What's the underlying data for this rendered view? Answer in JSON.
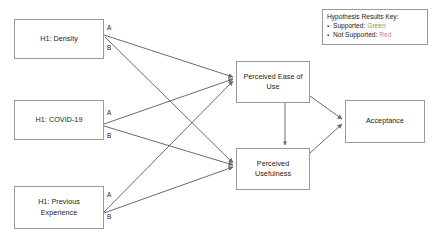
{
  "diagram": {
    "nodes": {
      "density": {
        "label": "H1: Density"
      },
      "covid": {
        "label": "H1: COVID-19"
      },
      "previous": {
        "label": "H1: Previous\nExperience"
      },
      "ease_of_use": {
        "label": "Perceived Ease of Use"
      },
      "usefulness": {
        "label": "Perceived Usefulness"
      },
      "acceptance": {
        "label": "Acceptance"
      }
    },
    "path_labels": {
      "density_a": "A",
      "density_b": "B",
      "covid_a": "A",
      "covid_b": "B",
      "previous_a": "A",
      "previous_b": "B"
    },
    "edges": [
      {
        "from": "density",
        "to": "ease_of_use",
        "label": "A"
      },
      {
        "from": "density",
        "to": "usefulness",
        "label": "B"
      },
      {
        "from": "covid",
        "to": "ease_of_use",
        "label": "A"
      },
      {
        "from": "covid",
        "to": "usefulness",
        "label": "B"
      },
      {
        "from": "previous",
        "to": "ease_of_use",
        "label": "A"
      },
      {
        "from": "previous",
        "to": "usefulness",
        "label": "B"
      },
      {
        "from": "ease_of_use",
        "to": "usefulness",
        "label": ""
      },
      {
        "from": "ease_of_use",
        "to": "acceptance",
        "label": ""
      },
      {
        "from": "usefulness",
        "to": "acceptance",
        "label": ""
      }
    ]
  },
  "legend": {
    "title": "Hypothesis Results Key:",
    "bullet": "▪",
    "items": [
      {
        "term": "Supported:",
        "value": "Green",
        "color": "#7a9a6d"
      },
      {
        "term": "Not Supported:",
        "value": "Red",
        "color": "#c08a86"
      }
    ]
  },
  "colors": {
    "box_border": "#9a9a9a",
    "connector": "#6b6b6b",
    "text": "#1a1a1a",
    "background": "#ffffff",
    "supported": "#7a9a6d",
    "not_supported": "#c08a86"
  }
}
